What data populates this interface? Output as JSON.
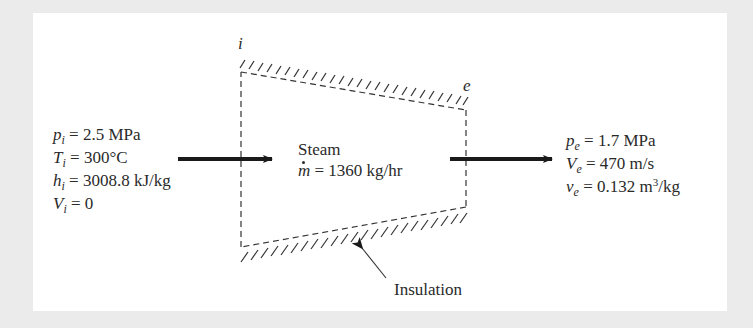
{
  "diagram": {
    "state_labels": {
      "inlet": "i",
      "exit": "e"
    },
    "inlet": {
      "lines": [
        {
          "symbol": "p",
          "subscript": "i",
          "value": "= 2.5 MPa"
        },
        {
          "symbol": "T",
          "subscript": "i",
          "value": "= 300°C"
        },
        {
          "symbol": "h",
          "subscript": "i",
          "value": "= 3008.8 kJ/kg"
        },
        {
          "symbol": "V",
          "subscript": "i",
          "value": "= 0"
        }
      ]
    },
    "control_volume": {
      "fluid": "Steam",
      "mass_flow_symbol": "m",
      "mass_flow_value": "= 1360 kg/hr"
    },
    "exit": {
      "lines": [
        {
          "symbol": "p",
          "subscript": "e",
          "value": "= 1.7 MPa"
        },
        {
          "symbol": "V",
          "subscript": "e",
          "value": "= 470 m/s"
        },
        {
          "symbol": "v",
          "subscript": "e",
          "value": "= 0.132 m",
          "superscript": "3",
          "tail": "/kg"
        }
      ]
    },
    "annotation": "Insulation",
    "colors": {
      "background": "#ebebeb",
      "panel": "#ffffff",
      "ink": "#2a2a2a"
    }
  }
}
